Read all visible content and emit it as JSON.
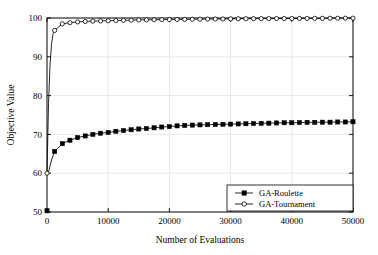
{
  "chart_data": {
    "type": "line",
    "title": "",
    "xlabel": "Number of Evaluations",
    "ylabel": "Objective Value",
    "xlim": [
      0,
      50000
    ],
    "ylim": [
      50,
      100
    ],
    "xticks": [
      0,
      10000,
      20000,
      30000,
      40000,
      50000
    ],
    "xtick_labels": [
      "0",
      "10000",
      "20000",
      "30000",
      "40000",
      "50000"
    ],
    "yticks": [
      50,
      60,
      70,
      80,
      90,
      100
    ],
    "ytick_labels": [
      "50",
      "60",
      "70",
      "80",
      "90",
      "100"
    ],
    "grid": true,
    "legend_position": "lower right",
    "series": [
      {
        "name": "GA-Roulette",
        "marker": "filled-square",
        "color": "#000000",
        "x": [
          0,
          250,
          500,
          750,
          1000,
          1250,
          2500,
          3750,
          5000,
          6250,
          7500,
          8750,
          10000,
          11250,
          12500,
          13750,
          15000,
          16250,
          17500,
          18750,
          20000,
          21250,
          22500,
          23750,
          25000,
          26250,
          27500,
          28750,
          30000,
          31250,
          32500,
          33750,
          35000,
          36250,
          37500,
          38750,
          40000,
          41250,
          42500,
          43750,
          45000,
          46250,
          47500,
          48750,
          50000
        ],
        "y": [
          50.3,
          60.2,
          61.9,
          63.4,
          64.6,
          65.6,
          67.6,
          68.5,
          69.2,
          69.6,
          70.0,
          70.3,
          70.5,
          70.8,
          71.0,
          71.2,
          71.4,
          71.5,
          71.7,
          71.9,
          72.0,
          72.2,
          72.3,
          72.4,
          72.45,
          72.5,
          72.55,
          72.6,
          72.65,
          72.7,
          72.75,
          72.8,
          72.85,
          72.9,
          72.95,
          73.0,
          73.0,
          73.05,
          73.1,
          73.1,
          73.15,
          73.15,
          73.2,
          73.2,
          73.25
        ]
      },
      {
        "name": "GA-Tournament",
        "marker": "open-circle",
        "color": "#000000",
        "x": [
          0,
          250,
          500,
          750,
          1000,
          1250,
          2500,
          3750,
          5000,
          6250,
          7500,
          8750,
          10000,
          11250,
          12500,
          13750,
          15000,
          16250,
          17500,
          18750,
          20000,
          21250,
          22500,
          23750,
          25000,
          26250,
          27500,
          28750,
          30000,
          31250,
          32500,
          33750,
          35000,
          36250,
          37500,
          38750,
          40000,
          41250,
          42500,
          43750,
          45000,
          46250,
          47500,
          48750,
          50000
        ],
        "y": [
          60.0,
          78.0,
          88.0,
          93.5,
          96.0,
          96.8,
          98.5,
          98.8,
          99.0,
          99.1,
          99.2,
          99.25,
          99.3,
          99.35,
          99.4,
          99.45,
          99.5,
          99.52,
          99.55,
          99.58,
          99.6,
          99.62,
          99.65,
          99.68,
          99.7,
          99.72,
          99.74,
          99.76,
          99.78,
          99.8,
          99.82,
          99.83,
          99.84,
          99.85,
          99.86,
          99.87,
          99.88,
          99.89,
          99.9,
          99.91,
          99.92,
          99.93,
          99.94,
          99.95,
          99.96
        ]
      }
    ]
  }
}
